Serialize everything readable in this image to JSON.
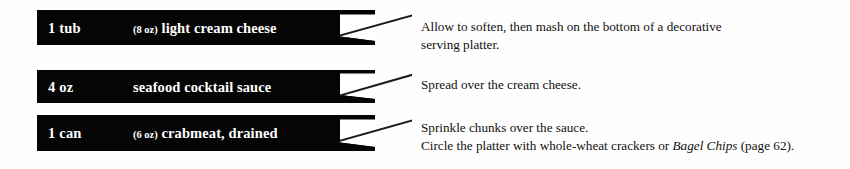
{
  "page": {
    "background_color": "#ffffff",
    "bar_color": "#050505",
    "bar_text_color": "#ffffff",
    "instruction_text_color": "#111111"
  },
  "rows": [
    {
      "quantity": "1 tub",
      "size": "(8 oz)",
      "ingredient": "light cream cheese",
      "instructions": [
        "Allow to soften, then mash on the bottom of a decorative",
        "serving platter."
      ]
    },
    {
      "quantity": "4 oz",
      "size": "",
      "ingredient": "seafood cocktail sauce",
      "instructions": [
        "Spread over the cream cheese."
      ]
    },
    {
      "quantity": "1 can",
      "size": "(6 oz)",
      "ingredient": "crabmeat, drained",
      "instructions": [
        "Sprinkle chunks over the sauce.",
        "Circle the platter with whole-wheat crackers or Bagel Chips (page 62)."
      ],
      "instruction_3_parts": {
        "before_italic": "Circle the platter with whole-wheat crackers or ",
        "italic": "Bagel Chips",
        "after_italic": " (page 62)."
      }
    }
  ]
}
